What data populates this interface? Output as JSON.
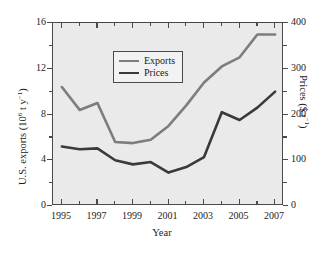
{
  "chart_data": {
    "type": "line",
    "title": "",
    "xlabel": "Year",
    "ylabel": "U.S. exports (10⁶ t y⁻¹)",
    "ylabel_right": "Prices ($ t⁻¹)",
    "x": [
      1995,
      1996,
      1997,
      1998,
      1999,
      2000,
      2001,
      2002,
      2003,
      2004,
      2005,
      2006,
      2007
    ],
    "xlim": [
      1994.5,
      2007.5
    ],
    "ylim": [
      0,
      16
    ],
    "ylim_right": [
      0,
      400
    ],
    "grid": false,
    "legend_position": "upper-left",
    "series": [
      {
        "name": "Exports",
        "axis": "left",
        "units": "10^6 t y^-1",
        "color": "#7d7d7d",
        "values": [
          10.4,
          8.4,
          9.0,
          5.6,
          5.5,
          5.8,
          7.0,
          8.8,
          10.8,
          12.2,
          13.0,
          15.0,
          15.0
        ]
      },
      {
        "name": "Prices",
        "axis": "right",
        "units": "$ t^-1",
        "color": "#3a3a3a",
        "values": [
          130,
          124,
          126,
          100,
          91,
          96,
          73,
          85,
          107,
          205,
          188,
          215,
          250
        ]
      }
    ],
    "xticks_major": [
      1995,
      1997,
      1999,
      2001,
      2003,
      2005,
      2007
    ],
    "xticks_minor": [
      1996,
      1998,
      2000,
      2002,
      2004,
      2006
    ],
    "xticklabels": [
      "1995",
      "1997",
      "1999",
      "2001",
      "2003",
      "2005",
      "2007"
    ],
    "yticks_left_major": [
      0,
      4,
      8,
      12,
      16
    ],
    "yticks_left_minor": [
      2,
      6,
      10,
      14
    ],
    "yticklabels_left": [
      "0",
      "4",
      "8",
      "12",
      "16"
    ],
    "yticks_right_major": [
      0,
      100,
      200,
      300,
      400
    ],
    "yticks_right_minor": [
      50,
      150,
      250,
      350
    ],
    "yticklabels_right": [
      "0",
      "100",
      "200",
      "300",
      "400"
    ]
  },
  "legend": {
    "items": [
      {
        "label": "Exports",
        "color": "#7d7d7d"
      },
      {
        "label": "Prices",
        "color": "#3a3a3a"
      }
    ]
  },
  "colors": {
    "exports": "#7d7d7d",
    "prices": "#3a3a3a",
    "plot_background": "#eaeaea",
    "axis": "#4a4a4a",
    "text": "#1c1c1c",
    "figure_background": "#ffffff"
  }
}
